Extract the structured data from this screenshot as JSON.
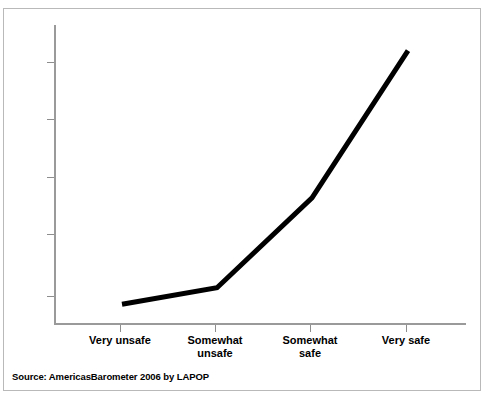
{
  "chart_data": {
    "type": "line",
    "title": "",
    "subtitle": "",
    "xlabel": "",
    "ylabel": "Support Rule of Law (Scale 0-100)",
    "categories": [
      "Very unsafe",
      "Somewhat unsafe",
      "Somewhat safe",
      "Very safe"
    ],
    "values": [
      51.6,
      52.4,
      56.9,
      62.4
    ],
    "series": [
      {
        "name": "Support Rule of Law",
        "values": [
          51.6,
          52.4,
          56.9,
          62.4
        ]
      }
    ],
    "ytick_labels": [
      "62",
      "60",
      "58",
      "55",
      "52"
    ],
    "ytick_values": [
      62,
      60,
      58,
      55,
      52
    ],
    "ylim": [
      51.2,
      63.0
    ],
    "grid": false,
    "legend": false,
    "legend_position": "none",
    "line_color": "#000000",
    "line_width": 5,
    "background_color": "#ffffff",
    "axis_color": "#9a9a9a",
    "annotations": []
  },
  "yaxis": {
    "title": "Support Rule of Law (Scale 0-100)",
    "ticks": [
      {
        "label": "62",
        "value": 62,
        "y": 62
      },
      {
        "label": "60",
        "value": 60,
        "y": 119
      },
      {
        "label": "58",
        "value": 58,
        "y": 177
      },
      {
        "label": "55",
        "value": 55,
        "y": 234
      },
      {
        "label": "52",
        "value": 52,
        "y": 296
      }
    ]
  },
  "xaxis": {
    "title": "",
    "ticks": [
      {
        "label": "Very unsafe",
        "line1": "Very unsafe",
        "line2": "",
        "x": 120
      },
      {
        "label": "Somewhat unsafe",
        "line1": "Somewhat",
        "line2": "unsafe",
        "x": 215
      },
      {
        "label": "Somewhat safe",
        "line1": "Somewhat",
        "line2": "safe",
        "x": 310
      },
      {
        "label": "Very safe",
        "line1": "Very safe",
        "line2": "",
        "x": 406
      }
    ]
  },
  "footer": {
    "source": "Source: AmericasBarometer 2006 by LAPOP"
  }
}
